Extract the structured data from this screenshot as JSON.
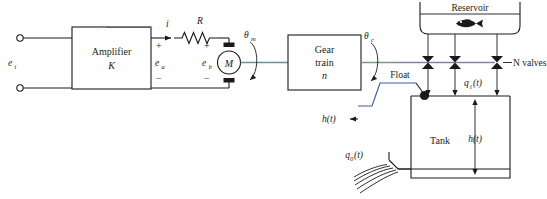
{
  "diagram": {
    "blocks": [
      {
        "id": "amplifier",
        "line1": "Amplifier",
        "line2": "K"
      },
      {
        "id": "gear_train",
        "line1": "Gear",
        "line2": "train",
        "line3": "n"
      }
    ],
    "labels": {
      "input_voltage": "e",
      "input_voltage_sub": "i",
      "armature_current": "i",
      "resistance": "R",
      "amplifier_output_voltage": "e",
      "amplifier_output_voltage_sub": "a",
      "back_emf": "e",
      "back_emf_sub": "b",
      "motor": "M",
      "motor_angle": "θ",
      "motor_angle_sub": "m",
      "control_angle": "θ",
      "control_angle_sub": "c",
      "reservoir": "Reservoir",
      "valves": "N valves",
      "inflow": "q",
      "inflow_sub": "i",
      "inflow_arg": "(t)",
      "outflow": "q",
      "outflow_sub": "0",
      "outflow_arg": "(t)",
      "float": "Float",
      "tank": "Tank",
      "height_left": "h(t)",
      "height_right": "h(t)",
      "plus": "+",
      "minus": "−"
    },
    "icons": {
      "fish": "fish-icon",
      "motor": "motor-icon",
      "resistor": "resistor-icon",
      "valve": "valve-icon",
      "float_ball": "float-ball-icon",
      "terminal": "terminal-icon",
      "rotation_arrow": "rotation-arrow-icon",
      "ground_hatch": "outflow-hatch-icon"
    },
    "counts": {
      "valves": 3
    },
    "colors": {
      "ink": "#1a1a1a",
      "shaft_motor": "#6e8f96",
      "shaft_valve": "#8d7fa0",
      "shaft_gear": "#7a9a7e",
      "accent_red": "#c0392b",
      "accent_blue": "#3f5fa8",
      "background": "#ffffff"
    }
  }
}
